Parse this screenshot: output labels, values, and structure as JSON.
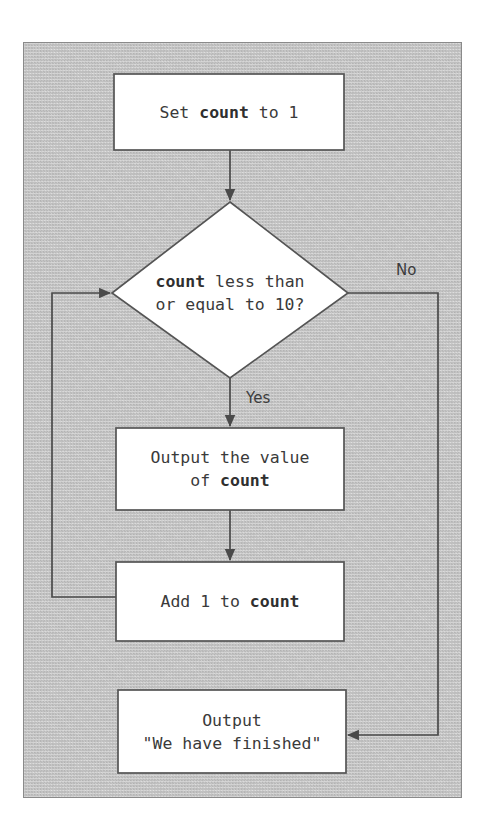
{
  "figure": {
    "kind": "flowchart",
    "panel": {
      "background_color": "#cbcbcb",
      "border_color": "#8a8a8a",
      "texture": "speckled-grain"
    },
    "node_fill": "#ffffff",
    "node_stroke": "#555555",
    "connector_color": "#4a4a4a",
    "text_color": "#3a3a3a"
  },
  "nodes": [
    {
      "id": "start",
      "shape": "rectangle",
      "name": "set-count-box",
      "lines": [
        [
          {
            "text": "Set ",
            "bold": false
          },
          {
            "text": "count",
            "bold": true
          },
          {
            "text": " to 1",
            "bold": false
          }
        ]
      ],
      "plain_text": "Set count to 1"
    },
    {
      "id": "decision",
      "shape": "diamond",
      "name": "count-condition-diamond",
      "lines": [
        [
          {
            "text": "count",
            "bold": true
          },
          {
            "text": " less than",
            "bold": false
          }
        ],
        [
          {
            "text": "or equal to 10?",
            "bold": false
          }
        ]
      ],
      "plain_text": "count less than or equal to 10?"
    },
    {
      "id": "output",
      "shape": "rectangle",
      "name": "output-count-box",
      "lines": [
        [
          {
            "text": "Output the value",
            "bold": false
          }
        ],
        [
          {
            "text": "of ",
            "bold": false
          },
          {
            "text": "count",
            "bold": true
          }
        ]
      ],
      "plain_text": "Output the value of count"
    },
    {
      "id": "increment",
      "shape": "rectangle",
      "name": "add-one-box",
      "lines": [
        [
          {
            "text": "Add 1 to ",
            "bold": false
          },
          {
            "text": "count",
            "bold": true
          }
        ]
      ],
      "plain_text": "Add 1 to count"
    },
    {
      "id": "finish",
      "shape": "rectangle",
      "name": "output-finished-box",
      "lines": [
        [
          {
            "text": "Output",
            "bold": false
          }
        ],
        [
          {
            "text": "\"We have finished\"",
            "bold": false
          }
        ]
      ],
      "plain_text": "Output \"We have finished\""
    }
  ],
  "edge_labels": {
    "no": "No",
    "yes": "Yes"
  },
  "edges": [
    {
      "from": "start",
      "to": "decision",
      "label": ""
    },
    {
      "from": "decision",
      "to": "output",
      "label": "Yes"
    },
    {
      "from": "decision",
      "to": "finish",
      "label": "No"
    },
    {
      "from": "output",
      "to": "increment",
      "label": ""
    },
    {
      "from": "increment",
      "to": "decision",
      "label": ""
    }
  ]
}
